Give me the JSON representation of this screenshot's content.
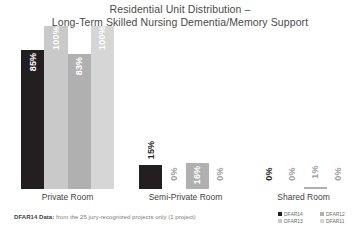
{
  "title": {
    "line1": "Residential Unit Distribution –",
    "line2": "Long-Term Skilled Nursing Dementia/Memory Support"
  },
  "footnote": {
    "bold": "DFAR14 Data:",
    "rest": " from the 25 jury-recognized projects only (1 project)"
  },
  "legend": {
    "items": [
      {
        "label": "DFAR14",
        "color": "#231f20"
      },
      {
        "label": "DFAR12",
        "color": "#b0b0b0"
      },
      {
        "label": "DFAR13",
        "color": "#c9c9c9"
      },
      {
        "label": "DFAR11",
        "color": "#d6d6d6"
      }
    ]
  },
  "chart_data": {
    "type": "bar",
    "title": "Residential Unit Distribution – Long-Term Skilled Nursing Dementia/Memory Support",
    "xlabel": "",
    "ylabel": "",
    "ylim": [
      0,
      100
    ],
    "grid": false,
    "legend_position": "bottom-right",
    "categories": [
      "Private Room",
      "Semi-Private Room",
      "Shared Room"
    ],
    "series": [
      {
        "name": "DFAR14",
        "color": "#231f20",
        "values": [
          85,
          15,
          0
        ],
        "labels": [
          "85%",
          "15%",
          "0%"
        ]
      },
      {
        "name": "DFAR13",
        "color": "#c9c9c9",
        "values": [
          100,
          0,
          0
        ],
        "labels": [
          "100%",
          "0%",
          "0%"
        ]
      },
      {
        "name": "DFAR12",
        "color": "#b0b0b0",
        "values": [
          83,
          16,
          1
        ],
        "labels": [
          "83%",
          "16%",
          "1%"
        ]
      },
      {
        "name": "DFAR11",
        "color": "#d6d6d6",
        "values": [
          100,
          0,
          0
        ],
        "labels": [
          "100%",
          "0%",
          "0%"
        ]
      }
    ]
  }
}
